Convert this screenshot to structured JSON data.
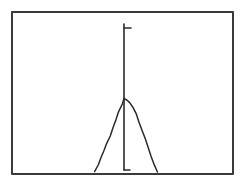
{
  "figure": {
    "title": "",
    "caption": "",
    "kind": "hand-drawn-sketch",
    "background_color": "#ffffff",
    "ink_color": "#2b2b2b",
    "frame_color": "#3a3a3a"
  },
  "frame": {
    "name": "outer-border",
    "x": 12,
    "y": 12,
    "width": 221,
    "height": 162,
    "stroke_width": 2
  },
  "axis": {
    "name": "vertical-centre-axis",
    "x": 124,
    "y_top": 24,
    "y_bottom": 170,
    "stroke_width": 1.6,
    "tick_top": {
      "name": "axis-tick-top",
      "x_start": 124,
      "x_end": 131,
      "y": 28
    },
    "foot_bottom": {
      "name": "axis-foot-bottom",
      "x_start": 124,
      "x_end": 130,
      "y": 170
    }
  },
  "chart_data": {
    "type": "line",
    "title": "",
    "subtitle": "",
    "xlabel": "",
    "ylabel": "",
    "grid": false,
    "legend": null,
    "legend_position": "none",
    "annotations": [],
    "xlim": [
      12,
      233
    ],
    "ylim": [
      174,
      12
    ],
    "curve_name": "bell-curve",
    "peak": {
      "x": 124,
      "y": 99
    },
    "left_tail_end": {
      "x": 95,
      "y": 172
    },
    "right_tail_end": {
      "x": 157,
      "y": 172
    },
    "x": [
      95,
      98,
      101,
      104,
      107,
      110,
      113,
      116,
      119,
      122,
      124,
      127,
      130,
      133,
      136,
      139,
      142,
      145,
      148,
      151,
      154,
      157
    ],
    "y": [
      172,
      165,
      158,
      151,
      144,
      136,
      128,
      120,
      112,
      104,
      99,
      100,
      103,
      108,
      114,
      122,
      130,
      139,
      148,
      156,
      164,
      172
    ],
    "values": [
      2,
      9,
      16,
      23,
      30,
      38,
      46,
      54,
      62,
      70,
      75,
      74,
      71,
      66,
      60,
      52,
      44,
      35,
      26,
      18,
      10,
      2
    ],
    "categories": [
      "-2.6",
      "-2.4",
      "-2.1",
      "-1.8",
      "-1.6",
      "-1.3",
      "-1.0",
      "-0.7",
      "-0.5",
      "-0.2",
      "0.0",
      "0.3",
      "0.5",
      "0.8",
      "1.1",
      "1.4",
      "1.6",
      "1.9",
      "2.2",
      "2.5",
      "2.7",
      "3.0"
    ]
  }
}
